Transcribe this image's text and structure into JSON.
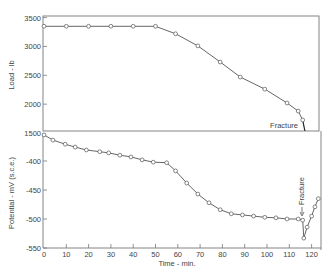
{
  "chart_data": [
    {
      "type": "line",
      "title": "",
      "xlabel": "",
      "ylabel": "Load - lb",
      "xlim": [
        0,
        125
      ],
      "ylim": [
        1500,
        3500
      ],
      "yticks": [
        1500,
        2000,
        2500,
        3000,
        3500
      ],
      "ytick_labels": [
        "1500",
        "2000",
        "2500",
        "3000",
        "3500"
      ],
      "grid": false,
      "legend": null,
      "series": [
        {
          "name": "Load",
          "marker": "open-circle",
          "x": [
            0,
            10,
            20,
            30,
            40,
            50,
            59,
            69,
            79,
            88,
            99,
            109,
            114,
            116
          ],
          "y": [
            3350,
            3350,
            3350,
            3350,
            3350,
            3350,
            3220,
            3010,
            2730,
            2470,
            2260,
            2020,
            1880,
            1725
          ]
        }
      ],
      "fracture_line": {
        "x": [
          116,
          117
        ],
        "y": [
          1725,
          1500
        ]
      },
      "annotations": [
        {
          "text": "Fracture",
          "x": 116,
          "y": 1560
        }
      ]
    },
    {
      "type": "line",
      "title": "",
      "xlabel": "Time - min.",
      "ylabel": "Potential - mV (s.c.e.)",
      "xlim": [
        0,
        125
      ],
      "ylim": [
        -550,
        -355
      ],
      "xticks": [
        0,
        10,
        20,
        30,
        40,
        50,
        60,
        70,
        80,
        90,
        100,
        110,
        120
      ],
      "xtick_labels": [
        "0",
        "10",
        "20",
        "30",
        "40",
        "50",
        "60",
        "70",
        "80",
        "90",
        "100",
        "110",
        "120"
      ],
      "yticks": [
        -400,
        -450,
        -500,
        -550
      ],
      "ytick_labels": [
        "-400",
        "-450",
        "-500",
        "-550"
      ],
      "grid": false,
      "legend": null,
      "series": [
        {
          "name": "Potential",
          "marker": "open-circle",
          "x": [
            0,
            4,
            9.5,
            14,
            19,
            25,
            29,
            34,
            39,
            44,
            49,
            55,
            59,
            64,
            69,
            74,
            79,
            84,
            89,
            94,
            99,
            104,
            109,
            114,
            116,
            116.5,
            118,
            120,
            121.5,
            123
          ],
          "y": [
            -355,
            -364,
            -371,
            -376,
            -381,
            -384,
            -386,
            -390,
            -393,
            -398,
            -402,
            -403,
            -417,
            -438,
            -457,
            -472,
            -484,
            -491,
            -493,
            -495,
            -497,
            -498,
            -500,
            -500,
            -502,
            -533,
            -514,
            -495,
            -479,
            -465
          ]
        }
      ],
      "annotations": [
        {
          "text": "Fracture",
          "x": 116,
          "y": -480,
          "orientation": "vertical",
          "arrow": true
        }
      ]
    }
  ],
  "labels": {
    "top_ylabel": "Load - lb",
    "bottom_ylabel": "Potential - mV (s.c.e.)",
    "xlabel": "Time - min.",
    "fracture_top": "Fracture",
    "fracture_bottom": "Fracture"
  },
  "layout": {
    "x0": 44,
    "px_per_min": 2.23,
    "top": {
      "left": 43,
      "right": 319,
      "top": 16,
      "bottom": 131,
      "ref_val": 1500,
      "ref_px": 133,
      "px_per_unit": 0.0577
    },
    "bottom": {
      "left": 43,
      "right": 321,
      "top": 133,
      "bottom": 248,
      "ref_val": -400,
      "ref_px": 161,
      "px_per_unit": 0.58
    }
  },
  "colors": {
    "line": "#555555",
    "axis": "#777777",
    "text": "#444444",
    "marker_fill": "#ffffff"
  }
}
